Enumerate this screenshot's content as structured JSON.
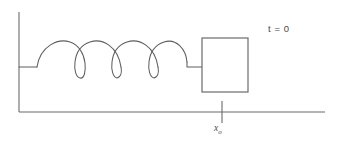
{
  "figure": {
    "labels": {
      "time": "t = 0",
      "position_symbol": "x",
      "position_subscript": "o"
    },
    "colors": {
      "line": "#6b6b6b",
      "spring": "#5e5e5e",
      "background": "#ffffff",
      "text": "#4a4a4a"
    },
    "elements": {
      "wall": {
        "name": "wall",
        "x": 19,
        "y_top": 12,
        "y_bottom": 112
      },
      "ground": {
        "name": "ground",
        "y": 112,
        "x_start": 19,
        "x_end": 325
      },
      "spring": {
        "name": "spring",
        "coil_count": 3,
        "arc_count": 4,
        "x_start": 19,
        "x_end": 202,
        "axis_y": 67,
        "arc_peak_y": 42,
        "loop_bottom_y": 78,
        "lead_in_end_x": 37,
        "lead_out_start_x": 185
      },
      "block": {
        "name": "block",
        "x": 202,
        "y": 38,
        "width": 46,
        "height": 54
      },
      "position_tick": {
        "name": "position-tick",
        "x": 222,
        "y_top": 101,
        "y_bottom": 123
      }
    }
  }
}
